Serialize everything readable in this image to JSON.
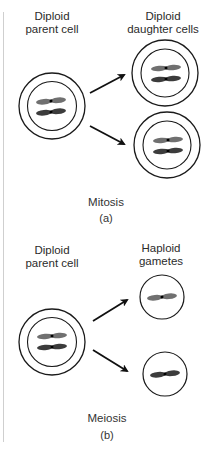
{
  "panels": [
    {
      "id": "a",
      "process": "Mitosis",
      "caption": "Mitosis",
      "sub_label": "(a)",
      "parent_label_line1": "Diploid",
      "parent_label_line2": "parent cell",
      "offspring_label_line1": "Diploid",
      "offspring_label_line2": "daughter cells",
      "parent_chromosomes": 2,
      "offspring_count": 2,
      "offspring_chromosomes_each": 2
    },
    {
      "id": "b",
      "process": "Meiosis",
      "caption": "Meiosis",
      "sub_label": "(b)",
      "parent_label_line1": "Diploid",
      "parent_label_line2": "parent cell",
      "offspring_label_line1": "Haploid",
      "offspring_label_line2": "gametes",
      "parent_chromosomes": 2,
      "offspring_count": 2,
      "offspring_chromosomes_each": 1
    }
  ],
  "colors": {
    "cell_outline": "#1a1a1a",
    "chromosome_light": "#6e6e6e",
    "chromosome_dark": "#3a3a3a",
    "centromere": "#000000",
    "arrow": "#111111",
    "text": "#2b2b2b",
    "edge_line": "#cfcfcf"
  }
}
